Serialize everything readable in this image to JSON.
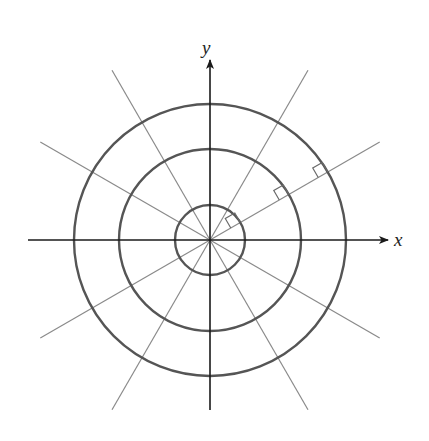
{
  "diagram": {
    "type": "polar-grid",
    "axes": {
      "x_label": "x",
      "y_label": "y"
    },
    "center": [
      210,
      240
    ],
    "circles": [
      {
        "name": "inner",
        "radius": 35
      },
      {
        "name": "middle",
        "radius": 91
      },
      {
        "name": "outer",
        "radius": 136
      }
    ],
    "radial_lines_deg": [
      30,
      60,
      120,
      150,
      210,
      240,
      300,
      330
    ],
    "right_angle_marks": {
      "ray_deg": 30,
      "at_radii": [
        35,
        91,
        136
      ],
      "size": 11
    },
    "colors": {
      "axis": "#1a1a1a",
      "circle": "#555555",
      "radial": "#8a8a8a",
      "background": "#ffffff"
    }
  }
}
